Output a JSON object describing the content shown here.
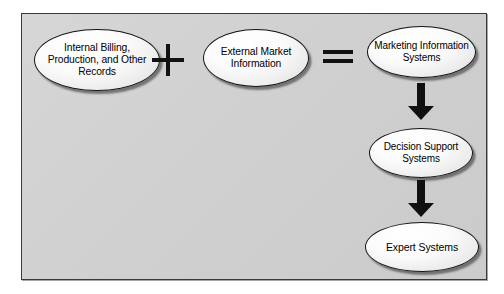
{
  "diagram": {
    "background_color": "#d0d0d0",
    "border_color": "#3a3a3a",
    "nodes": [
      {
        "id": "internal-records",
        "label": "Internal Billing, Production, and Other Records",
        "shape": "ellipse"
      },
      {
        "id": "external-market",
        "label": "External Market Information",
        "shape": "ellipse"
      },
      {
        "id": "marketing-is",
        "label": "Marketing Information Systems",
        "shape": "ellipse"
      },
      {
        "id": "decision-support",
        "label": "Decision Support Systems",
        "shape": "ellipse"
      },
      {
        "id": "expert-systems",
        "label": "Expert Systems",
        "shape": "ellipse"
      }
    ],
    "operators": {
      "plus": "+",
      "equals": "="
    },
    "arrows": [
      {
        "id": "mis-to-dss",
        "from": "marketing-is",
        "to": "decision-support",
        "direction": "down"
      },
      {
        "id": "dss-to-es",
        "from": "decision-support",
        "to": "expert-systems",
        "direction": "down"
      }
    ]
  }
}
